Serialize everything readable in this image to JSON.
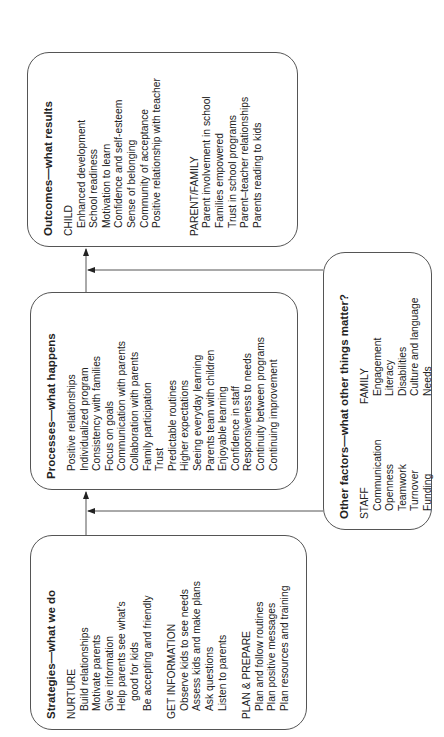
{
  "diagram": {
    "outcomes": {
      "title": "Outcomes—what results",
      "groups": [
        {
          "heading": "CHILD",
          "items": [
            "Enhanced development",
            "School readiness",
            "Motivation to learn",
            "Confidence and self-esteem",
            "Sense of belonging",
            "Community of acceptance",
            "Positive relationship with teacher"
          ]
        },
        {
          "heading": "PARENT/FAMILY",
          "items": [
            "Parent involvement in school",
            "Families empowered",
            "Trust in school programs",
            "Parent–teacher relationships",
            "Parents reading to kids"
          ]
        }
      ]
    },
    "processes": {
      "title": "Processes—what happens",
      "items": [
        "Positive relationships",
        "Individualized program",
        "Consistency with families",
        "Focus on goals",
        "Communication with parents",
        "Collaboration with parents",
        "Family participation",
        "Trust",
        "Predictable routines",
        "Higher expectations",
        "Seeing everyday learning",
        "Parents team with children",
        "Enjoyable learning",
        "Confidence in staff",
        "Responsiveness to needs",
        "Continuity between programs",
        "Continuing improvement"
      ]
    },
    "strategies": {
      "title": "Strategies—what we do",
      "groups": [
        {
          "heading": "NURTURE",
          "items": [
            "Build relationships",
            "Motivate parents",
            "Give information",
            "Help parents see what’s",
            "good for kids",
            "Be accepting and friendly"
          ]
        },
        {
          "heading": "GET INFORMATION",
          "items": [
            "Observe kids to see needs",
            "Assess kids and make plans",
            "Ask questions",
            "Listen to parents"
          ]
        },
        {
          "heading": "PLAN & PREPARE",
          "items": [
            "Plan and follow routines",
            "Plan positive messages",
            "Plan resources and training"
          ]
        }
      ]
    },
    "other_factors": {
      "title": "Other factors—what other things matter?",
      "staff": {
        "heading": "STAFF",
        "items": [
          "Communication",
          "Openness",
          "Teamwork",
          "Turnover",
          "Funding"
        ]
      },
      "family": {
        "heading": "FAMILY",
        "items": [
          "Engagement",
          "Literacy",
          "Disabilities",
          "Culture and language",
          "Needs"
        ]
      }
    },
    "colors": {
      "line": "#555555",
      "text": "#222222",
      "background": "#ffffff"
    }
  }
}
